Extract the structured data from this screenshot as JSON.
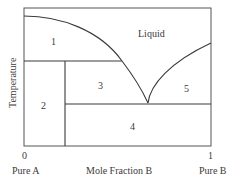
{
  "diagram": {
    "type": "binary phase diagram (eutectic)",
    "y_axis_label": "Temperature",
    "x_axis_label": "Mole Fraction B",
    "x_tick_left": "0",
    "x_tick_right": "1",
    "x_end_left": "Pure A",
    "x_end_right": "Pure B",
    "regions": {
      "liquid": "Liquid",
      "r1": "1",
      "r2": "2",
      "r3": "3",
      "r4": "4",
      "r5": "5"
    },
    "colors": {
      "line": "#3a3a3a",
      "background": "#ffffff"
    }
  }
}
